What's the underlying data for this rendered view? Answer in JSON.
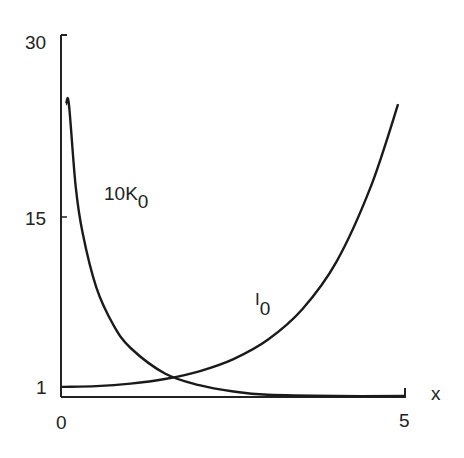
{
  "chart_data": {
    "type": "line",
    "title": "",
    "xlabel": "x",
    "ylabel": "",
    "xlim": [
      0,
      5
    ],
    "ylim": [
      0,
      30
    ],
    "x_ticks": [
      "0",
      "5"
    ],
    "y_ticks": [
      "1",
      "15",
      "30"
    ],
    "grid": false,
    "legend": "inline labels",
    "series": [
      {
        "name": "I0",
        "label_main": "I",
        "label_sub": "0",
        "x": [
          0,
          0.5,
          1,
          1.5,
          2,
          2.5,
          3,
          3.5,
          4,
          4.5,
          4.9
        ],
        "values": [
          1.0,
          1.06,
          1.27,
          1.65,
          2.28,
          3.29,
          4.88,
          7.38,
          11.3,
          17.48,
          24.3
        ]
      },
      {
        "name": "10K0",
        "label_main": "10K",
        "label_sub": "0",
        "x": [
          0.06,
          0.1,
          0.2,
          0.3,
          0.5,
          0.75,
          1,
          1.5,
          2,
          2.5,
          3,
          4,
          5
        ],
        "values": [
          24.3,
          24.3,
          17.5,
          13.7,
          9.2,
          6.1,
          4.2,
          2.1,
          1.14,
          0.62,
          0.35,
          0.11,
          0.04
        ]
      }
    ],
    "annotations": [
      {
        "text": "10K0",
        "x": 0.75,
        "y": 17
      },
      {
        "text": "I0",
        "x": 2.85,
        "y": 7
      }
    ]
  },
  "axes": {
    "x_label": "x",
    "x_tick_0": "0",
    "x_tick_5": "5",
    "y_tick_1": "1",
    "y_tick_15": "15",
    "y_tick_30": "30"
  },
  "labels": {
    "k_main": "10K",
    "k_sub": "0",
    "i_main": "I",
    "i_sub": "0"
  }
}
